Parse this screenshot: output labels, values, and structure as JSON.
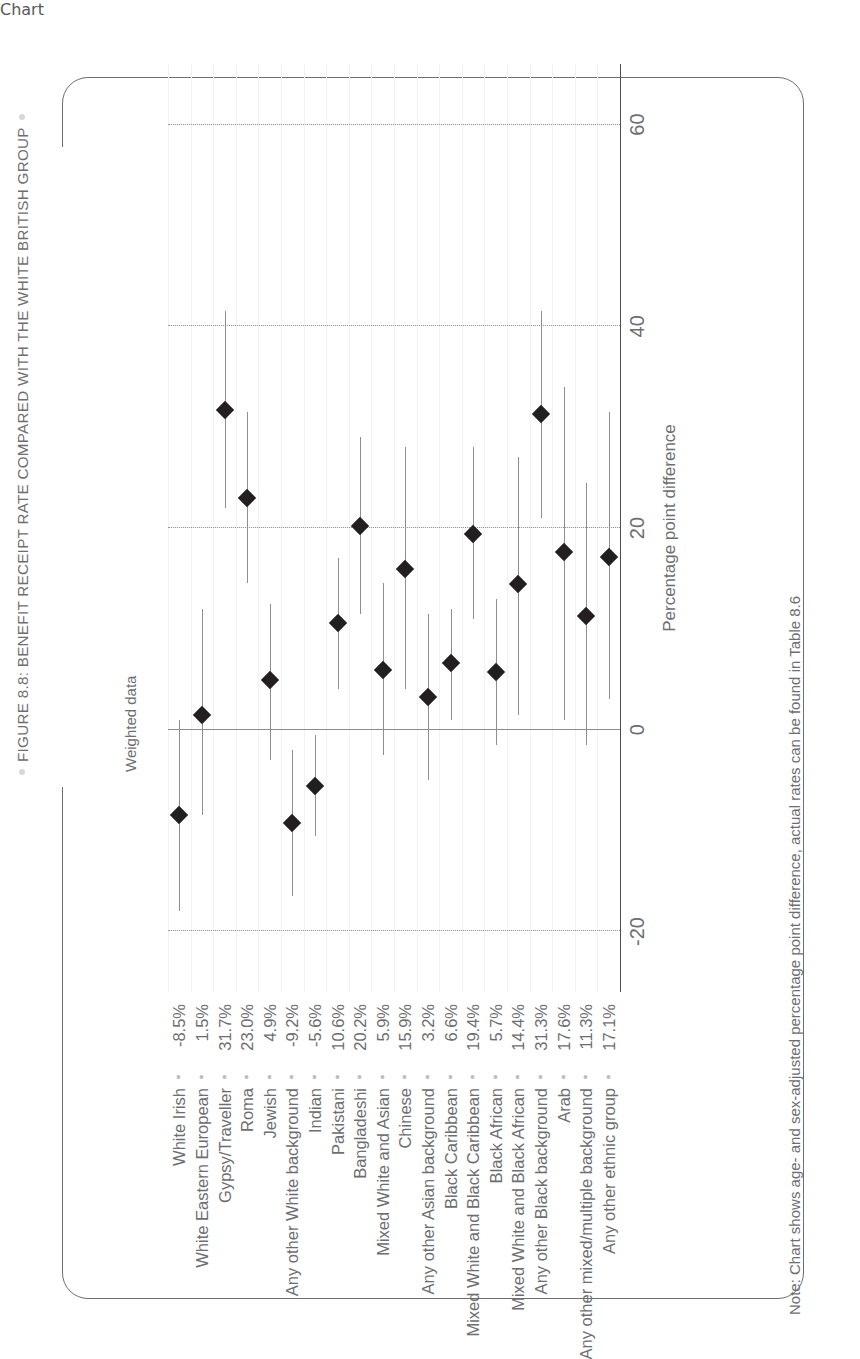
{
  "figure": {
    "title": "FIGURE 8.8: BENEFIT RECEIPT RATE COMPARED WITH THE WHITE BRITISH GROUP",
    "weighted_label": "Weighted data",
    "note": "Note: Chart shows age- and sex-adjusted percentage point difference, actual rates can be found in Table 8.6"
  },
  "chart_data": {
    "type": "scatter",
    "title": "FIGURE 8.8: BENEFIT RECEIPT RATE COMPARED WITH THE WHITE BRITISH GROUP",
    "subtitle": "Weighted data",
    "xlabel": "Percentage point difference",
    "ylabel": "",
    "xlim": [
      -26,
      66
    ],
    "xticks": [
      -20,
      0,
      20,
      40,
      60
    ],
    "xticklabels": [
      "-20",
      "0",
      "20",
      "40",
      "60"
    ],
    "grid": "dotted horizontal gridlines at -20, 20, 40, 60; solid reference line at 0",
    "legend": "none",
    "orientation": "horizontal point estimates with 95% confidence interval whiskers",
    "categories": [
      "White Irish",
      "White Eastern European",
      "Gypsy/Traveller",
      "Roma",
      "Jewish",
      "Any other White background",
      "Indian",
      "Pakistani",
      "Bangladeshi",
      "Mixed White and Asian",
      "Chinese",
      "Any other Asian background",
      "Black Caribbean",
      "Mixed White and Black Caribbean",
      "Black African",
      "Mixed White and Black African",
      "Any other Black background",
      "Arab",
      "Any other mixed/multiple background",
      "Any other ethnic group"
    ],
    "value_labels": [
      "-8.5%",
      "1.5%",
      "31.7%",
      "23.0%",
      "4.9%",
      "-9.2%",
      "-5.6%",
      "10.6%",
      "20.2%",
      "5.9%",
      "15.9%",
      "3.2%",
      "6.6%",
      "19.4%",
      "5.7%",
      "14.4%",
      "31.3%",
      "17.6%",
      "11.3%",
      "17.1%"
    ],
    "values": [
      -8.5,
      1.5,
      31.7,
      23.0,
      4.9,
      -9.2,
      -5.6,
      10.6,
      20.2,
      5.9,
      15.9,
      3.2,
      6.6,
      19.4,
      5.7,
      14.4,
      31.3,
      17.6,
      11.3,
      17.1
    ],
    "ci_low": [
      -18.0,
      -8.5,
      22.0,
      14.5,
      -3.0,
      -16.5,
      -10.5,
      4.0,
      11.5,
      -2.5,
      4.0,
      -5.0,
      1.0,
      11.0,
      -1.5,
      1.5,
      21.0,
      1.0,
      -1.5,
      3.0
    ],
    "ci_high": [
      1.0,
      12.0,
      41.5,
      31.5,
      12.5,
      -2.0,
      -0.5,
      17.0,
      29.0,
      14.5,
      28.0,
      11.5,
      12.0,
      28.0,
      13.0,
      27.0,
      41.5,
      34.0,
      24.5,
      31.5
    ]
  },
  "axis": {
    "tick_labels": [
      "-20",
      "0",
      "20",
      "40",
      "60"
    ],
    "title": "Percentage point difference"
  }
}
